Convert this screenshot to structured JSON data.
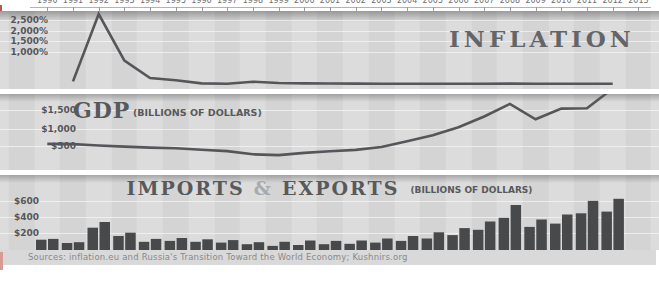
{
  "top_axis": {
    "years": [
      "1990",
      "1991",
      "1992",
      "1993",
      "1994",
      "1995",
      "1996",
      "1997",
      "1998",
      "1999",
      "2000",
      "2001",
      "2002",
      "2003",
      "2004",
      "2005",
      "2006",
      "2007",
      "2008",
      "2009",
      "2010",
      "2011",
      "2012",
      "2013"
    ]
  },
  "charts": {
    "inflation": {
      "title": "INFLATION",
      "y_labels": [
        "2,500%",
        "2,000%",
        "1,500%",
        "1,000%"
      ]
    },
    "gdp": {
      "title": "GDP",
      "subtitle": "(BILLIONS OF DOLLARS)",
      "y_labels": [
        "$1,500",
        "$1,000",
        "$500"
      ]
    },
    "trade": {
      "title_imports": "IMPORTS",
      "amp": "&",
      "title_exports": "EXPORTS",
      "subtitle": "(BILLIONS OF DOLLARS)",
      "y_labels": [
        "$600",
        "$400",
        "$200"
      ]
    }
  },
  "footer": {
    "sources": "Sources: inflation.eu and Russia's Transition Toward the World Economy; Kushnirs.org"
  },
  "colors": {
    "panel_band_dark": "#d4d4d4",
    "panel_band_light": "#dcdcdc",
    "ink": "#55565a",
    "line": "#55565a",
    "bar": "#48494b",
    "amp_gray": "#a7a9ac",
    "source_text": "#87898c",
    "source_band": "#d9d9d9",
    "edge_mark_red": "#c0544d",
    "edge_mark_pink": "#d99a96"
  },
  "chart_data": [
    {
      "type": "line",
      "title": "INFLATION",
      "ylabel": "annual inflation, %",
      "ytick_labels": [
        "1,000%",
        "1,500%",
        "2,000%",
        "2,500%"
      ],
      "ylim": [
        0,
        2700
      ],
      "grid": true,
      "legend": "none",
      "x": [
        1991,
        1992,
        1993,
        1994,
        1995,
        1996,
        1997,
        1998,
        1999,
        2000,
        2001,
        2002,
        2003,
        2004,
        2005,
        2006,
        2007,
        2008,
        2009,
        2010,
        2011,
        2012
      ],
      "values": [
        93,
        2509,
        840,
        215,
        131,
        22,
        11,
        84,
        37,
        20,
        19,
        15,
        12,
        12,
        11,
        9,
        12,
        13,
        9,
        9,
        6,
        7
      ]
    },
    {
      "type": "line",
      "title": "GDP (BILLIONS OF DOLLARS)",
      "ylabel": "GDP, billions of dollars",
      "ytick_labels": [
        "$500",
        "$1,000",
        "$1,500"
      ],
      "ylim": [
        0,
        2200
      ],
      "grid": true,
      "legend": "none",
      "x": [
        1990,
        1991,
        1992,
        1993,
        1994,
        1995,
        1996,
        1997,
        1998,
        1999,
        2000,
        2001,
        2002,
        2003,
        2004,
        2005,
        2006,
        2007,
        2008,
        2009,
        2010,
        2011,
        2012
      ],
      "values": [
        516,
        510,
        470,
        440,
        410,
        390,
        350,
        310,
        220,
        196,
        260,
        307,
        345,
        430,
        590,
        765,
        990,
        1300,
        1660,
        1220,
        1525,
        1535,
        2100
      ]
    },
    {
      "type": "bar",
      "title": "IMPORTS & EXPORTS (BILLIONS OF DOLLARS)",
      "ylabel": "billions of dollars",
      "ytick_labels": [
        "$200",
        "$400",
        "$600"
      ],
      "ylim": [
        0,
        650
      ],
      "grid": true,
      "legend": "none",
      "categories": [
        1990,
        1991,
        1992,
        1993,
        1994,
        1995,
        1996,
        1997,
        1998,
        1999,
        2000,
        2001,
        2002,
        2003,
        2004,
        2005,
        2006,
        2007,
        2008,
        2009,
        2010,
        2011,
        2012
      ],
      "series": [
        {
          "name": "IMPORTS",
          "values": [
            125,
            85,
            270,
            170,
            100,
            110,
            100,
            90,
            70,
            50,
            60,
            70,
            75,
            90,
            110,
            140,
            180,
            245,
            390,
            280,
            320,
            445,
            465
          ]
        },
        {
          "name": "EXPORTS",
          "values": [
            135,
            95,
            340,
            210,
            135,
            145,
            130,
            120,
            95,
            100,
            115,
            110,
            115,
            140,
            170,
            215,
            265,
            345,
            545,
            370,
            430,
            595,
            620
          ]
        }
      ]
    }
  ]
}
